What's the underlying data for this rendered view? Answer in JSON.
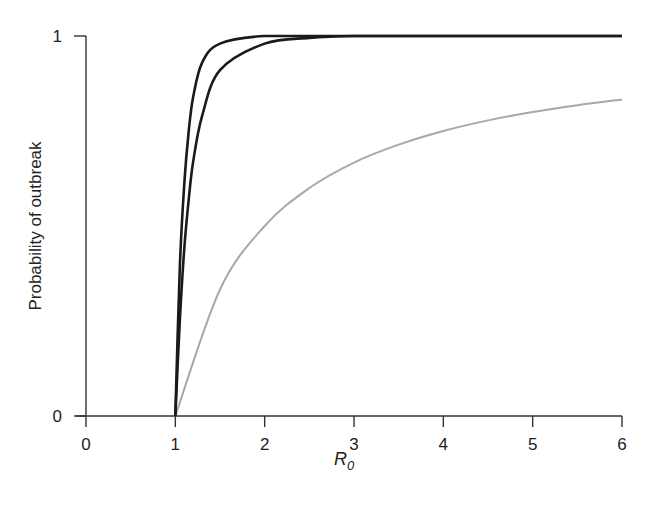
{
  "chart_data": {
    "type": "line",
    "title": "",
    "xlabel": "R0",
    "xlabel_main": "R",
    "xlabel_sub": "0",
    "ylabel": "Probability of outbreak",
    "xlim": [
      0,
      6
    ],
    "ylim": [
      0,
      1
    ],
    "xticks": [
      "0",
      "1",
      "2",
      "3",
      "4",
      "5",
      "6"
    ],
    "yticks": [
      "0",
      "1"
    ],
    "grid": false,
    "legend": null,
    "series": [
      {
        "name": "steep curve (black)",
        "color": "#1a1a1a",
        "x": [
          1,
          1.05,
          1.1,
          1.15,
          1.2,
          1.3,
          1.5,
          2,
          3,
          4,
          5,
          6
        ],
        "y": [
          0,
          0.39,
          0.61,
          0.75,
          0.84,
          0.93,
          0.98,
          1.0,
          1.0,
          1.0,
          1.0,
          1.0
        ]
      },
      {
        "name": "intermediate curve (black)",
        "color": "#1a1a1a",
        "x": [
          1,
          1.05,
          1.1,
          1.15,
          1.2,
          1.3,
          1.5,
          2,
          2.5,
          3,
          4,
          5,
          6
        ],
        "y": [
          0,
          0.25,
          0.44,
          0.57,
          0.67,
          0.79,
          0.91,
          0.98,
          0.995,
          1.0,
          1.0,
          1.0,
          1.0
        ]
      },
      {
        "name": "1 - 1/R0 (gray)",
        "color": "#a8a8a8",
        "x": [
          1,
          1.5,
          2,
          2.5,
          3,
          3.5,
          4,
          4.5,
          5,
          5.5,
          6
        ],
        "y": [
          0,
          0.333,
          0.5,
          0.6,
          0.667,
          0.714,
          0.75,
          0.778,
          0.8,
          0.818,
          0.833
        ]
      }
    ]
  }
}
